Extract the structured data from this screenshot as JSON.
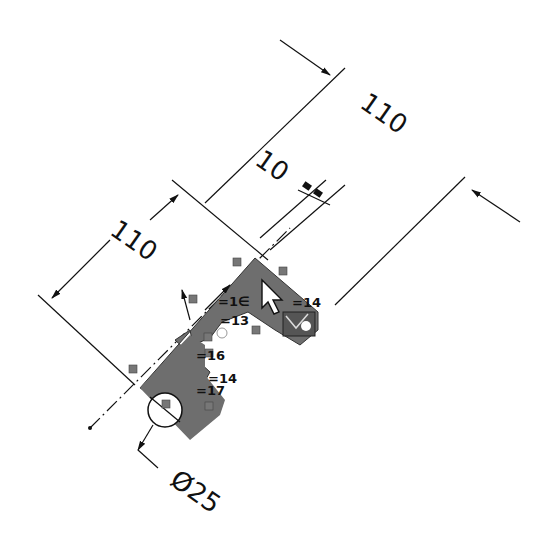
{
  "view": {
    "type": "CAD sketch",
    "background": "#ffffff",
    "region_fill": "#6e6e6e",
    "line_color": "#111111",
    "glyph_color": "#555555"
  },
  "dimensions": [
    {
      "id": "dim-top-110",
      "label": "110",
      "orientation": "diagonal"
    },
    {
      "id": "dim-left-110",
      "label": "110",
      "orientation": "diagonal"
    },
    {
      "id": "dim-offset-10",
      "label": "10",
      "orientation": "diagonal"
    },
    {
      "id": "dim-diameter-25",
      "label": "Ø25",
      "orientation": "diagonal"
    }
  ],
  "relations": [
    {
      "label": "=14",
      "position": "upper-right"
    },
    {
      "label": "=1∈",
      "position": "upper-middle"
    },
    {
      "label": "=13",
      "position": "middle"
    },
    {
      "label": "=16",
      "position": "lower-middle"
    },
    {
      "label": "=14",
      "position": "lower-right"
    },
    {
      "label": "=17",
      "position": "lower"
    }
  ],
  "cursor": {
    "type": "select-arrow-with-sketch-icon"
  }
}
